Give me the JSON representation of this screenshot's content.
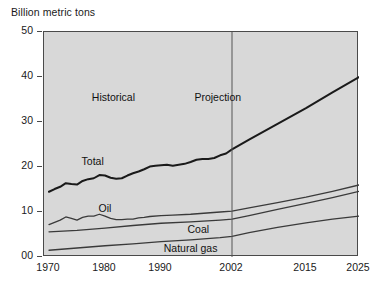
{
  "chart_data": {
    "type": "line",
    "title": "",
    "xlabel": "",
    "ylabel": "Billion metric tons",
    "ylim": [
      0,
      50
    ],
    "xlim": [
      1970,
      2025
    ],
    "grid": false,
    "legend_position": "inline-labels",
    "y_ticks": [
      "00",
      "10",
      "20",
      "30",
      "40",
      "50"
    ],
    "y_tick_values": [
      0,
      10,
      20,
      30,
      40,
      50
    ],
    "x_ticks": [
      "1970",
      "1980",
      "1990",
      "2002",
      "2015",
      "2025"
    ],
    "x_tick_values": [
      1970,
      1980,
      1990,
      2002,
      2015,
      2025
    ],
    "annotations": [
      {
        "text": "Historical",
        "x": 1981.5,
        "y": 35.5
      },
      {
        "text": "Projection",
        "x": 1999.6,
        "y": 35.5
      },
      {
        "text": "Total",
        "x": 1977.8,
        "y": 21.3
      },
      {
        "text": "Oil",
        "x": 1980.0,
        "y": 10.8
      },
      {
        "text": "Coal",
        "x": 1996.3,
        "y": 6.2
      },
      {
        "text": "Natural gas",
        "x": 1995.0,
        "y": 2.0
      }
    ],
    "divider": {
      "label": "2002",
      "x": 2002
    },
    "series": [
      {
        "name": "Total",
        "color": "#1a1a1a",
        "width": 2.0,
        "x": [
          1970,
          1971,
          1972,
          1973,
          1974,
          1975,
          1976,
          1977,
          1978,
          1979,
          1980,
          1981,
          1982,
          1983,
          1984,
          1985,
          1986,
          1987,
          1988,
          1989,
          1990,
          1991,
          1992,
          1993,
          1994,
          1995,
          1996,
          1997,
          1998,
          1999,
          2000,
          2001,
          2002,
          2005,
          2010,
          2015,
          2020,
          2025
        ],
        "y": [
          14.5,
          15.1,
          15.6,
          16.4,
          16.2,
          16.1,
          16.9,
          17.3,
          17.5,
          18.2,
          18.1,
          17.6,
          17.4,
          17.5,
          18.1,
          18.6,
          19.0,
          19.5,
          20.1,
          20.3,
          20.4,
          20.5,
          20.3,
          20.5,
          20.7,
          21.1,
          21.6,
          21.8,
          21.8,
          22.0,
          22.6,
          23.0,
          23.9,
          26.1,
          29.6,
          33.1,
          36.6,
          40.0
        ]
      },
      {
        "name": "Oil",
        "color": "#3a3a3a",
        "width": 1.3,
        "x": [
          1970,
          1972,
          1973,
          1974,
          1975,
          1976,
          1977,
          1978,
          1979,
          1980,
          1981,
          1982,
          1983,
          1984,
          1985,
          1986,
          1987,
          1988,
          1990,
          1992,
          1995,
          2000,
          2002,
          2005,
          2010,
          2015,
          2020,
          2025
        ],
        "y": [
          7.2,
          8.2,
          8.9,
          8.6,
          8.2,
          8.8,
          9.1,
          9.1,
          9.5,
          9.1,
          8.6,
          8.3,
          8.3,
          8.4,
          8.4,
          8.7,
          8.8,
          9.0,
          9.2,
          9.3,
          9.5,
          10.0,
          10.2,
          10.9,
          12.1,
          13.3,
          14.6,
          16.0
        ]
      },
      {
        "name": "Coal",
        "color": "#3a3a3a",
        "width": 1.3,
        "x": [
          1970,
          1975,
          1980,
          1985,
          1990,
          1995,
          2000,
          2002,
          2005,
          2010,
          2015,
          2020,
          2025
        ],
        "y": [
          5.6,
          5.9,
          6.4,
          7.0,
          7.5,
          7.8,
          8.2,
          8.4,
          9.2,
          10.6,
          11.9,
          13.2,
          14.6
        ]
      },
      {
        "name": "Natural gas",
        "color": "#3a3a3a",
        "width": 1.3,
        "x": [
          1970,
          1975,
          1980,
          1985,
          1990,
          1995,
          2000,
          2002,
          2005,
          2010,
          2015,
          2020,
          2025
        ],
        "y": [
          1.5,
          2.0,
          2.5,
          2.9,
          3.4,
          3.8,
          4.3,
          4.6,
          5.4,
          6.6,
          7.6,
          8.4,
          9.1
        ]
      }
    ]
  },
  "colors": {
    "plot_background": "#d8d8d8",
    "axis": "#4a4a4a",
    "text": "#1a1a1a",
    "total_line": "#1a1a1a",
    "fuel_line": "#3a3a3a",
    "divider_line": "#555555"
  }
}
